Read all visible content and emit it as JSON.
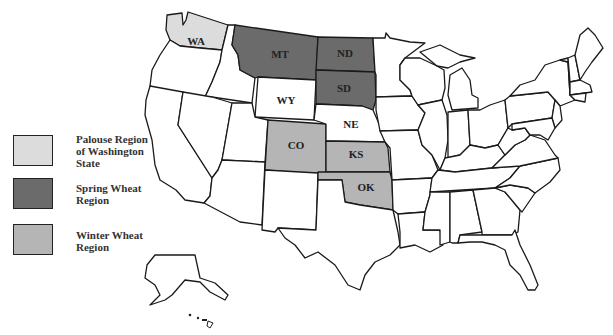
{
  "map": {
    "title": "",
    "state_labels": {
      "WA": "WA",
      "MT": "MT",
      "ND": "ND",
      "SD": "SD",
      "WY": "WY",
      "NE": "NE",
      "CO": "CO",
      "KS": "KS",
      "OK": "OK"
    },
    "colors": {
      "palouse": "#dcdcdc",
      "spring": "#6b6b6b",
      "winter": "#b5b5b5",
      "default": "#ffffff",
      "border": "#1a1a1a"
    },
    "highlighted_states": {
      "palouse": [
        "WA"
      ],
      "spring": [
        "MT",
        "ND",
        "SD"
      ],
      "winter": [
        "CO",
        "KS",
        "OK"
      ]
    }
  },
  "legend": {
    "items": [
      {
        "label": "Palouse Region of Washington State",
        "line1": "Palouse Region",
        "line2": "of Washington",
        "line3": "State",
        "color": "#dcdcdc"
      },
      {
        "label": "Spring Wheat Region",
        "line1": "Spring Wheat",
        "line2": "Region",
        "color": "#6b6b6b"
      },
      {
        "label": "Winter Wheat Region",
        "line1": "Winter Wheat",
        "line2": "Region",
        "color": "#b5b5b5"
      }
    ]
  }
}
